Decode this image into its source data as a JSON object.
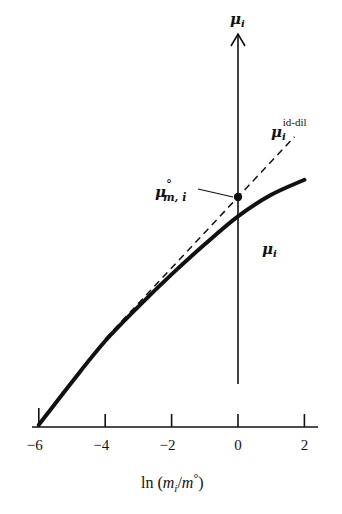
{
  "chart_data": {
    "type": "line",
    "title": "",
    "xlabel_parts": {
      "prefix": "ln (",
      "m1": "m",
      "sub": "i",
      "slash": "/",
      "m2": "m",
      "sup": "°",
      "suffix": ")"
    },
    "ylabel": {
      "symbol": "μ",
      "sub": "i"
    },
    "x_ticks": [
      -6,
      -4,
      -2,
      0,
      2
    ],
    "x_tick_labels": [
      "−6",
      "−4",
      "−2",
      "0",
      "2"
    ],
    "xlim": [
      -6.2,
      2.5
    ],
    "series": [
      {
        "name": "μ_i",
        "style": "solid-thick",
        "label": {
          "symbol": "μ",
          "sub": "i"
        },
        "points": [
          [
            -6,
            -5.3
          ],
          [
            -5,
            -4.3
          ],
          [
            -4,
            -3.35
          ],
          [
            -3,
            -2.55
          ],
          [
            -2,
            -1.8
          ],
          [
            -1,
            -1.1
          ],
          [
            0,
            -0.45
          ],
          [
            1,
            0.05
          ],
          [
            2,
            0.4
          ]
        ]
      },
      {
        "name": "μ_i^id-dil",
        "style": "dashed",
        "label": {
          "symbol": "μ",
          "sub": "i",
          "sup": "id-dil"
        },
        "points": [
          [
            -4,
            -3.3
          ],
          [
            0,
            0
          ],
          [
            1.7,
            1.4
          ]
        ]
      }
    ],
    "annotations": [
      {
        "name": "standard-state-point",
        "x": 0,
        "y": 0,
        "label": {
          "symbol": "μ",
          "sup": "°",
          "sub": "m, i"
        }
      }
    ]
  }
}
